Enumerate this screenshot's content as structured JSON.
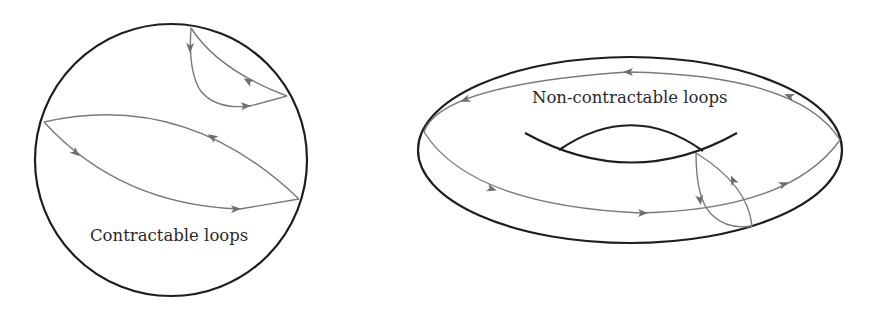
{
  "figure": {
    "left_panel": {
      "shape": "sphere (circle)",
      "label": "Contractable loops",
      "loops": [
        {
          "name": "small-loop-top-right",
          "arrows": [
            "down",
            "up-left",
            "right"
          ]
        },
        {
          "name": "large-loop-diagonal",
          "arrows": [
            "down-right",
            "right",
            "up-left"
          ]
        }
      ]
    },
    "right_panel": {
      "shape": "torus",
      "label": "Non-contractable loops",
      "loops": [
        {
          "name": "longitude-loop",
          "arrows": [
            "left",
            "down-left",
            "up-left",
            "right",
            "right",
            "up-right"
          ]
        },
        {
          "name": "meridian-loop",
          "arrows": [
            "down",
            "up"
          ]
        }
      ]
    },
    "colors": {
      "outline": "#1e1e1e",
      "loop": "#7a7a7a",
      "arrow": "#6e6e6e",
      "text": "#2a2a2a",
      "background": "#ffffff"
    }
  }
}
